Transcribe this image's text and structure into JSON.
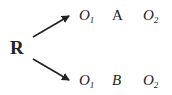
{
  "diagram": {
    "root": "R",
    "branches": [
      {
        "pre": {
          "base": "O",
          "sub": "1"
        },
        "treatment": "A",
        "post": {
          "base": "O",
          "sub": "2"
        }
      },
      {
        "pre": {
          "base": "O",
          "sub": "1"
        },
        "treatment": "B",
        "post": {
          "base": "O",
          "sub": "2"
        }
      }
    ]
  },
  "colors": {
    "ink": "#222222",
    "background": "#ffffff"
  }
}
